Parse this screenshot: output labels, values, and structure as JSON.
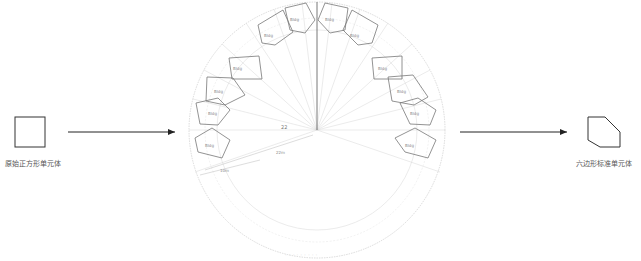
{
  "diagram": {
    "left_unit": {
      "shape": "square",
      "caption": "原始正方形单元体"
    },
    "right_unit": {
      "shape": "hexagon",
      "caption": "六边形标准单元体"
    },
    "center_figure": {
      "dimension_angle_label": "22",
      "dimension_inner_label": "22m",
      "dimension_outer_label": "10m",
      "cell_labels_left": [
        "Bldg",
        "Bldg",
        "Bldg",
        "Bldg",
        "Bldg",
        "Bldg",
        "Bldg"
      ],
      "cell_labels_right": [
        "Bldg",
        "Bldg",
        "Bldg",
        "Bldg",
        "Bldg",
        "Bldg",
        "Bldg"
      ],
      "bottom_caption": "· · ·   · · ·   · · ·"
    },
    "colors": {
      "line": "#333333",
      "faint": "#cccccc",
      "arrow": "#222222"
    }
  }
}
